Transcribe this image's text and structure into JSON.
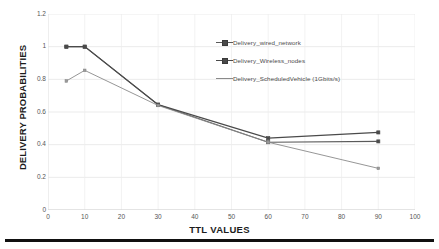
{
  "chart_data": {
    "type": "line",
    "title": "",
    "xlabel": "TTL VALUES",
    "ylabel": "DELIVERY PROBABILITIES",
    "xlim": [
      0,
      100
    ],
    "ylim": [
      0,
      1.2
    ],
    "xticks": [
      0,
      10,
      20,
      30,
      40,
      50,
      60,
      70,
      80,
      90,
      100
    ],
    "yticks": [
      0,
      0.2,
      0.4,
      0.6,
      0.8,
      1,
      1.2
    ],
    "xtick_labels": [
      "0",
      "10",
      "20",
      "30",
      "40",
      "50",
      "60",
      "70",
      "80",
      "90",
      "100"
    ],
    "ytick_labels": [
      "0",
      "0.2",
      "0.4",
      "0.6",
      "0.8",
      "1",
      "1.2"
    ],
    "grid": true,
    "legend_position": "upper right inside",
    "x": [
      5,
      10,
      30,
      60,
      90
    ],
    "series": [
      {
        "name": "Delivery_wired_network",
        "values": [
          1.0,
          1.0,
          0.645,
          0.415,
          0.42
        ],
        "color": "#5a5a5a",
        "marker": "square"
      },
      {
        "name": "Delivery_Wireless_nodes",
        "values": [
          1.0,
          1.0,
          0.645,
          0.44,
          0.475
        ],
        "color": "#4a4a4a",
        "marker": "square"
      },
      {
        "name": "Delivery_ScheduledVehicle (1Gbits/s)",
        "values": [
          0.79,
          0.855,
          0.64,
          0.415,
          0.255
        ],
        "color": "#8a8a8a",
        "marker": "square-small"
      }
    ]
  },
  "axis_titles": {
    "x": "TTL VALUES",
    "y": "DELIVERY PROBABILITIES"
  },
  "legend": {
    "items": [
      {
        "label": "Delivery_wired_network"
      },
      {
        "label": "Delivery_Wireless_nodes"
      },
      {
        "label": "Delivery_ScheduledVehicle (1Gbits/s)"
      }
    ]
  }
}
